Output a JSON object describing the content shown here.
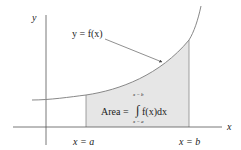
{
  "diagram": {
    "axes": {
      "x_label": "x",
      "y_label": "y"
    },
    "curve": {
      "label": "y = f(x)"
    },
    "bounds": {
      "lower_label": "x = a",
      "upper_label": "x = b"
    },
    "area": {
      "prefix": "Area =",
      "integrand": "f(x)dx",
      "integral_sign": "∫",
      "upper_limit": "x = b",
      "lower_limit": "x = a"
    },
    "colors": {
      "background": "#ffffff",
      "axis": "#555555",
      "curve": "#888888",
      "shade": "#e6e6e6",
      "text": "#222222",
      "arrow": "#444444"
    }
  }
}
